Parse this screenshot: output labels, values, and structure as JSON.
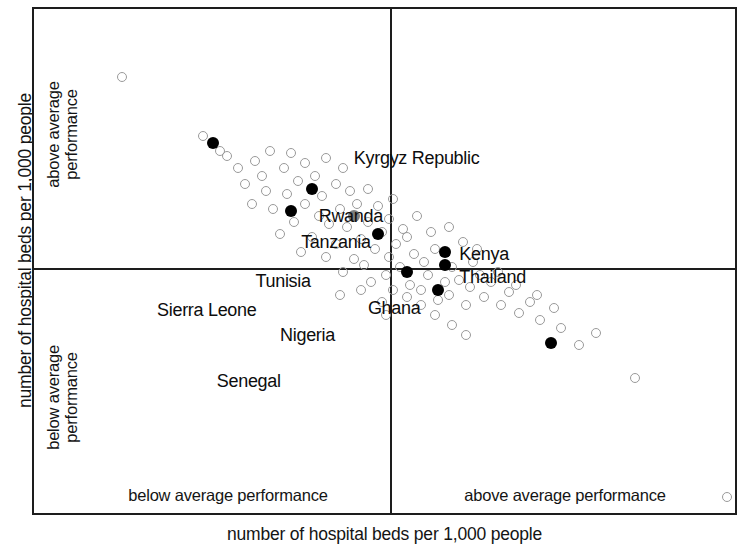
{
  "chart_data": {
    "type": "scatter",
    "title": "",
    "xlabel": "number of hospital beds per 1,000 people",
    "ylabel": "number of hospital beds per 1,000 people",
    "quadrant_labels": {
      "x_left": "below average performance",
      "x_right": "above average performance",
      "y_top_line1": "above average",
      "y_top_line2": "performance",
      "y_bottom_line1": "below average",
      "y_bottom_line2": "performance"
    },
    "grid": false,
    "legend": "none",
    "reference_lines": {
      "vertical_x_pct": 50.5,
      "horizontal_y_pct": 51.2,
      "meaning": "sample means splitting the plot into four performance quadrants"
    },
    "xlim": [
      0,
      100
    ],
    "ylim": [
      0,
      100
    ],
    "marker_styles": {
      "unlabeled": "hollow gray circle",
      "highlighted": "filled black circle",
      "ghana": "filled gray circle"
    },
    "colors": {
      "frame": "#1d1d1d",
      "hollow_marker": "#9a9a9a",
      "solid_marker": "#000000",
      "gray_marker": "#7e7e7e",
      "text": "#141414"
    },
    "labeled_points": [
      {
        "name": "Kyrgyz Republic",
        "x": 73.5,
        "y": 66.0,
        "style": "solid",
        "label_x": 45.5,
        "label_y": 27.5
      },
      {
        "name": "Rwanda",
        "x": 57.5,
        "y": 55.5,
        "style": "solid",
        "label_x": 40.5,
        "label_y": 39.0
      },
      {
        "name": "Tanzania",
        "x": 53.0,
        "y": 52.0,
        "style": "solid",
        "label_x": 38.0,
        "label_y": 44.0
      },
      {
        "name": "Kenya",
        "x": 58.5,
        "y": 50.5,
        "style": "solid",
        "label_x": 60.5,
        "label_y": 46.5
      },
      {
        "name": "Thailand",
        "x": 58.5,
        "y": 48.0,
        "style": "solid",
        "label_x": 60.5,
        "label_y": 51.0
      },
      {
        "name": "Tunisia",
        "x": 49.0,
        "y": 44.5,
        "style": "solid",
        "label_x": 31.5,
        "label_y": 51.8
      },
      {
        "name": "Ghana",
        "x": 45.5,
        "y": 41.0,
        "style": "gray",
        "label_x": 47.5,
        "label_y": 57.2
      },
      {
        "name": "Sierra Leone",
        "x": 36.5,
        "y": 40.0,
        "style": "solid",
        "label_x": 17.5,
        "label_y": 57.5
      },
      {
        "name": "Nigeria",
        "x": 39.5,
        "y": 35.5,
        "style": "solid",
        "label_x": 35.0,
        "label_y": 62.5
      },
      {
        "name": "Senegal",
        "x": 25.5,
        "y": 26.5,
        "style": "solid",
        "label_x": 26.0,
        "label_y": 71.5
      }
    ],
    "unlabeled_points": [
      {
        "x": 98.6,
        "y": 96.5
      },
      {
        "x": 85.5,
        "y": 73.0
      },
      {
        "x": 77.5,
        "y": 66.5
      },
      {
        "x": 80.0,
        "y": 64.0
      },
      {
        "x": 75.0,
        "y": 63.0
      },
      {
        "x": 72.0,
        "y": 61.5
      },
      {
        "x": 69.0,
        "y": 60.0
      },
      {
        "x": 74.0,
        "y": 59.0
      },
      {
        "x": 70.5,
        "y": 58.0
      },
      {
        "x": 66.5,
        "y": 58.5
      },
      {
        "x": 71.5,
        "y": 56.5
      },
      {
        "x": 67.5,
        "y": 56.0
      },
      {
        "x": 64.0,
        "y": 57.0
      },
      {
        "x": 68.5,
        "y": 54.5
      },
      {
        "x": 65.0,
        "y": 54.0
      },
      {
        "x": 62.0,
        "y": 55.0
      },
      {
        "x": 63.5,
        "y": 52.5
      },
      {
        "x": 60.5,
        "y": 53.5
      },
      {
        "x": 66.0,
        "y": 52.0
      },
      {
        "x": 59.0,
        "y": 56.5
      },
      {
        "x": 61.5,
        "y": 58.5
      },
      {
        "x": 57.5,
        "y": 57.5
      },
      {
        "x": 55.0,
        "y": 55.5
      },
      {
        "x": 58.5,
        "y": 54.0
      },
      {
        "x": 56.0,
        "y": 52.5
      },
      {
        "x": 53.5,
        "y": 54.5
      },
      {
        "x": 52.0,
        "y": 51.0
      },
      {
        "x": 55.5,
        "y": 50.0
      },
      {
        "x": 59.5,
        "y": 51.0
      },
      {
        "x": 62.5,
        "y": 50.0
      },
      {
        "x": 50.5,
        "y": 49.0
      },
      {
        "x": 54.0,
        "y": 48.5
      },
      {
        "x": 57.0,
        "y": 47.5
      },
      {
        "x": 51.5,
        "y": 46.5
      },
      {
        "x": 48.5,
        "y": 47.5
      },
      {
        "x": 47.0,
        "y": 50.5
      },
      {
        "x": 50.0,
        "y": 52.5
      },
      {
        "x": 48.0,
        "y": 54.0
      },
      {
        "x": 45.5,
        "y": 49.5
      },
      {
        "x": 44.0,
        "y": 52.0
      },
      {
        "x": 46.5,
        "y": 45.5
      },
      {
        "x": 49.5,
        "y": 44.0
      },
      {
        "x": 53.0,
        "y": 45.0
      },
      {
        "x": 43.0,
        "y": 46.5
      },
      {
        "x": 41.5,
        "y": 49.0
      },
      {
        "x": 44.5,
        "y": 43.0
      },
      {
        "x": 47.5,
        "y": 42.0
      },
      {
        "x": 42.0,
        "y": 42.5
      },
      {
        "x": 39.5,
        "y": 45.0
      },
      {
        "x": 38.0,
        "y": 48.0
      },
      {
        "x": 40.5,
        "y": 41.0
      },
      {
        "x": 43.5,
        "y": 39.5
      },
      {
        "x": 46.0,
        "y": 38.5
      },
      {
        "x": 37.0,
        "y": 42.0
      },
      {
        "x": 35.0,
        "y": 44.5
      },
      {
        "x": 38.5,
        "y": 38.5
      },
      {
        "x": 41.0,
        "y": 37.0
      },
      {
        "x": 34.0,
        "y": 39.5
      },
      {
        "x": 36.0,
        "y": 36.5
      },
      {
        "x": 33.0,
        "y": 36.0
      },
      {
        "x": 31.0,
        "y": 38.5
      },
      {
        "x": 37.5,
        "y": 34.0
      },
      {
        "x": 40.0,
        "y": 33.0
      },
      {
        "x": 43.0,
        "y": 34.5
      },
      {
        "x": 45.0,
        "y": 36.0
      },
      {
        "x": 30.0,
        "y": 34.5
      },
      {
        "x": 32.5,
        "y": 33.0
      },
      {
        "x": 35.5,
        "y": 31.5
      },
      {
        "x": 38.5,
        "y": 30.5
      },
      {
        "x": 29.0,
        "y": 31.5
      },
      {
        "x": 31.5,
        "y": 30.0
      },
      {
        "x": 27.5,
        "y": 29.0
      },
      {
        "x": 26.5,
        "y": 28.0
      },
      {
        "x": 24.0,
        "y": 25.0
      },
      {
        "x": 12.5,
        "y": 13.5
      },
      {
        "x": 50.5,
        "y": 41.5
      },
      {
        "x": 52.5,
        "y": 43.5
      },
      {
        "x": 54.5,
        "y": 41.0
      },
      {
        "x": 49.0,
        "y": 39.0
      },
      {
        "x": 51.0,
        "y": 37.5
      },
      {
        "x": 47.5,
        "y": 35.5
      },
      {
        "x": 44.0,
        "y": 31.5
      },
      {
        "x": 41.5,
        "y": 29.5
      },
      {
        "x": 36.5,
        "y": 28.5
      },
      {
        "x": 33.5,
        "y": 28.0
      },
      {
        "x": 56.5,
        "y": 44.0
      },
      {
        "x": 59.0,
        "y": 43.0
      },
      {
        "x": 61.0,
        "y": 46.0
      },
      {
        "x": 63.0,
        "y": 47.5
      },
      {
        "x": 55.0,
        "y": 58.5
      },
      {
        "x": 53.0,
        "y": 57.0
      },
      {
        "x": 51.0,
        "y": 55.5
      },
      {
        "x": 49.5,
        "y": 58.0
      },
      {
        "x": 46.5,
        "y": 55.5
      },
      {
        "x": 43.5,
        "y": 56.5
      },
      {
        "x": 50.0,
        "y": 60.5
      },
      {
        "x": 57.0,
        "y": 60.5
      },
      {
        "x": 59.5,
        "y": 62.5
      },
      {
        "x": 61.5,
        "y": 64.5
      }
    ]
  }
}
